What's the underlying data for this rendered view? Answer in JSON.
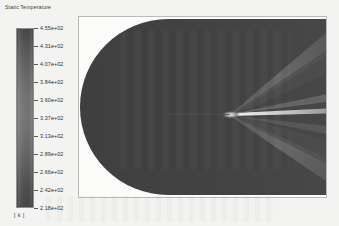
{
  "legend": {
    "title": "Static Temperature",
    "unit": "[ k ]",
    "ticks": [
      "4.55e+02",
      "4.31e+02",
      "4.07e+02",
      "3.84e+02",
      "3.60e+02",
      "3.37e+02",
      "3.13e+02",
      "2.89e+02",
      "2.66e+02",
      "2.42e+02",
      "2.18e+02"
    ]
  },
  "chart_data": {
    "type": "heatmap",
    "title": "Static Temperature",
    "colorbar_label": "[ k ]",
    "colormap": "grayscale",
    "vmin": 218,
    "vmax": 455,
    "units": "K",
    "tick_values": [
      455,
      431,
      407,
      384,
      360,
      337,
      313,
      289,
      266,
      242,
      218
    ],
    "tick_labels": [
      "4.55e+02",
      "4.31e+02",
      "4.07e+02",
      "3.84e+02",
      "3.60e+02",
      "3.37e+02",
      "3.13e+02",
      "2.89e+02",
      "2.66e+02",
      "2.42e+02",
      "2.18e+02"
    ],
    "features": [
      {
        "name": "freestream",
        "value": 250,
        "region": "upstream rounded domain"
      },
      {
        "name": "cone-apex",
        "x_frac": 0.62,
        "y_frac": 0.53
      },
      {
        "name": "oblique-shock-upper",
        "value": 400
      },
      {
        "name": "oblique-shock-lower",
        "value": 400
      },
      {
        "name": "post-shock-wake",
        "value": 455,
        "region": "axis line downstream of apex"
      }
    ],
    "grid": false,
    "legend_position": "left",
    "xlabel": "",
    "ylabel": ""
  }
}
